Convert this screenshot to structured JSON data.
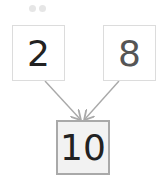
{
  "diagram": {
    "type": "number-bond",
    "parts": [
      {
        "value": "2",
        "color": "#222222"
      },
      {
        "value": "8",
        "color": "#555555"
      }
    ],
    "whole": {
      "value": "10",
      "color": "#222222"
    },
    "arrow_color": "#a9a9a9",
    "progress_dots": 2
  }
}
